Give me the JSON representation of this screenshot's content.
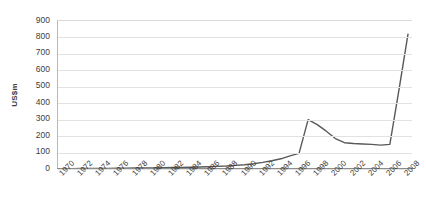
{
  "chart_data": {
    "type": "line",
    "title": "",
    "xlabel": "",
    "ylabel": "US$m",
    "ylim": [
      0,
      900
    ],
    "ytick_step": 100,
    "yticks": [
      900,
      800,
      700,
      600,
      500,
      400,
      300,
      200,
      100,
      0
    ],
    "grid": true,
    "legend": "none",
    "xtick_labels": [
      "1970",
      "1972",
      "1974",
      "1976",
      "1978",
      "1980",
      "1982",
      "1984",
      "1986",
      "1988",
      "1990",
      "1992",
      "1994",
      "1996",
      "1998",
      "2000",
      "2002",
      "2004",
      "2006",
      "2008"
    ],
    "xtick_rotation_deg": -45,
    "x": [
      1970,
      1971,
      1972,
      1973,
      1974,
      1975,
      1976,
      1977,
      1978,
      1979,
      1980,
      1981,
      1982,
      1983,
      1984,
      1985,
      1986,
      1987,
      1988,
      1989,
      1990,
      1991,
      1992,
      1993,
      1994,
      1995,
      1996,
      1997,
      1998,
      1999,
      2000,
      2001,
      2002,
      2003,
      2004,
      2005,
      2006,
      2007,
      2008
    ],
    "series": [
      {
        "name": "US$m",
        "color": "#595959",
        "values": [
          2,
          2,
          3,
          3,
          4,
          4,
          5,
          5,
          6,
          6,
          7,
          8,
          9,
          10,
          11,
          12,
          14,
          16,
          18,
          22,
          26,
          32,
          40,
          50,
          62,
          80,
          95,
          300,
          270,
          230,
          185,
          160,
          155,
          152,
          150,
          145,
          150,
          480,
          820
        ]
      }
    ],
    "annotations": {
      "peak_year": 1997,
      "peak_value": 300,
      "plateau_range": [
        155,
        145
      ],
      "final_year": 2008,
      "final_value": 820
    }
  },
  "colors": {
    "line": "#595959",
    "gridline": "#e2e2e2",
    "axis": "#8c8c8c",
    "text": "#3d3d3d",
    "background": "#ffffff"
  }
}
